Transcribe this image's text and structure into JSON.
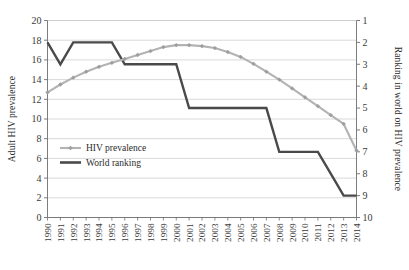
{
  "chart_data": {
    "type": "line",
    "title": "",
    "subtitle": "",
    "xlabel": "",
    "ylabel": "Adult HIV prevalence",
    "y2label": "Ranking in world on HIV prevalence",
    "grid": true,
    "legend_position": "inside-lower-left",
    "x": [
      1990,
      1991,
      1992,
      1993,
      1994,
      1995,
      1996,
      1997,
      1998,
      1999,
      2000,
      2001,
      2002,
      2003,
      2004,
      2005,
      2006,
      2007,
      2008,
      2009,
      2010,
      2011,
      2012,
      2013,
      2014
    ],
    "categories": [
      "1990",
      "1991",
      "1992",
      "1993",
      "1994",
      "1995",
      "1996",
      "1997",
      "1998",
      "1999",
      "2000",
      "2001",
      "2002",
      "2003",
      "2004",
      "2005",
      "2006",
      "2007",
      "2008",
      "2009",
      "2010",
      "2011",
      "2012",
      "2013",
      "2014"
    ],
    "ylim": [
      0,
      20
    ],
    "yticks": [
      0,
      2,
      4,
      6,
      8,
      10,
      12,
      14,
      16,
      18,
      20
    ],
    "y2lim": [
      10,
      1
    ],
    "y2ticks": [
      1,
      2,
      3,
      4,
      5,
      6,
      7,
      8,
      9,
      10
    ],
    "y2_inverted": true,
    "series": [
      {
        "name": "HIV prevalence",
        "axis": "left",
        "color": "#b3b3b3",
        "marker": "diamond",
        "values": [
          12.7,
          13.5,
          14.2,
          14.8,
          15.3,
          15.7,
          16.1,
          16.5,
          16.9,
          17.3,
          17.5,
          17.5,
          17.4,
          17.2,
          16.8,
          16.3,
          15.6,
          14.8,
          14.0,
          13.1,
          12.2,
          11.3,
          10.4,
          9.5,
          6.8
        ]
      },
      {
        "name": "World ranking",
        "axis": "right",
        "color": "#4a4a4a",
        "marker": "none",
        "values": [
          2,
          3,
          2,
          2,
          2,
          2,
          3,
          3,
          3,
          3,
          3,
          5,
          5,
          5,
          5,
          5,
          5,
          5,
          7,
          7,
          7,
          7,
          8,
          9,
          9
        ]
      }
    ]
  },
  "legend": {
    "items": [
      {
        "label": "HIV prevalence"
      },
      {
        "label": "World ranking"
      }
    ]
  },
  "axes": {
    "left_title": "Adult HIV prevalence",
    "right_title": "Ranking in world on HIV prevalence"
  },
  "colors": {
    "prevalence": "#b3b3b3",
    "ranking": "#4a4a4a",
    "grid": "#c9c9c9",
    "axis": "#6e6e6e",
    "text": "#2b2b2b"
  }
}
